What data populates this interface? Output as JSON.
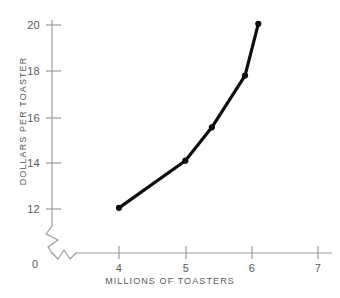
{
  "chart_data": {
    "type": "line",
    "title": "",
    "xlabel": "MILLIONS OF TOASTERS",
    "ylabel": "DOLLARS PER TOASTER",
    "xlim": [
      3.5,
      7.3
    ],
    "ylim": [
      11.3,
      20.6
    ],
    "xticks": [
      4,
      5,
      6,
      7
    ],
    "xticklabels": [
      "4",
      "5",
      "6",
      "7"
    ],
    "yticks": [
      12,
      14,
      16,
      18,
      20
    ],
    "yticklabels": [
      "12",
      "14",
      "16",
      "18",
      "20"
    ],
    "origin_label": "0",
    "axis_break": true,
    "grid": false,
    "legend": null,
    "series": [
      {
        "name": "supply",
        "x": [
          4.0,
          5.0,
          5.4,
          5.9,
          6.1
        ],
        "y": [
          12.05,
          14.1,
          15.55,
          17.8,
          20.05
        ],
        "color": "#0d0d0d",
        "marker": "circle",
        "linewidth": 3.2
      }
    ]
  },
  "style": {
    "axis_color": "#9a9a9c",
    "label_color": "#58585a",
    "line_color": "#0d0d0d",
    "background": "#ffffff"
  }
}
